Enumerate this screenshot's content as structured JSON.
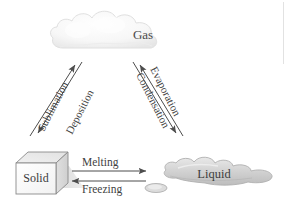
{
  "diagram": {
    "type": "phase-change-diagram",
    "states": [
      {
        "id": "gas",
        "label": "Gas",
        "shape": "cloud",
        "position": "top-center"
      },
      {
        "id": "solid",
        "label": "Solid",
        "shape": "cube",
        "position": "bottom-left"
      },
      {
        "id": "liquid",
        "label": "Liquid",
        "shape": "puddle",
        "position": "bottom-right"
      }
    ],
    "transitions": [
      {
        "id": "sublimation",
        "label": "Sublimation",
        "from": "solid",
        "to": "gas",
        "direction": "up-right",
        "side": "left"
      },
      {
        "id": "deposition",
        "label": "Deposition",
        "from": "gas",
        "to": "solid",
        "direction": "down-left",
        "side": "left"
      },
      {
        "id": "evaporation",
        "label": "Evaporation",
        "from": "liquid",
        "to": "gas",
        "direction": "up-left",
        "side": "right"
      },
      {
        "id": "condensation",
        "label": "Condensation",
        "from": "gas",
        "to": "liquid",
        "direction": "down-right",
        "side": "right"
      },
      {
        "id": "melting",
        "label": "Melting",
        "from": "solid",
        "to": "liquid",
        "direction": "right",
        "side": "bottom"
      },
      {
        "id": "freezing",
        "label": "Freezing",
        "from": "liquid",
        "to": "solid",
        "direction": "left",
        "side": "bottom"
      }
    ],
    "colors": {
      "background": "#ffffff",
      "text": "#3a3a3a",
      "arrow": "#4d4d4d",
      "cloud_fill": "#f6f6f6",
      "cloud_edge": "#e3e3e3",
      "puddle_fill": "#d8d8d8",
      "puddle_edge": "#b6b6b6",
      "cube_front": "#fbfbfb",
      "cube_top": "#ececec",
      "cube_side": "#dcdcdc",
      "cube_edge": "#8a8a8a",
      "shadow": "#c9c9c9",
      "rule": "#e2e2e2"
    }
  }
}
